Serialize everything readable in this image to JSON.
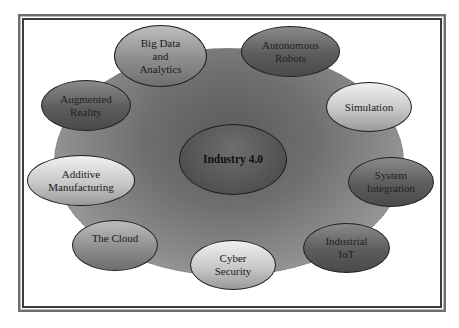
{
  "diagram": {
    "title": "Industry 4.0",
    "center": {
      "label": "Industry 4.0",
      "tone": "dark"
    },
    "nodes": [
      {
        "label": "Big Data\nand\nAnalytics",
        "tone": "mid"
      },
      {
        "label": "Autonomous\nRobots",
        "tone": "dark"
      },
      {
        "label": "Simulation",
        "tone": "light"
      },
      {
        "label": "System\nIntegration",
        "tone": "dark"
      },
      {
        "label": "Industrial\nIoT",
        "tone": "dark"
      },
      {
        "label": "Cyber\nSecurity",
        "tone": "light"
      },
      {
        "label": "The Cloud",
        "tone": "mid"
      },
      {
        "label": "Additive\nManufacturing",
        "tone": "light"
      },
      {
        "label": "Augmented\nReality",
        "tone": "dark"
      }
    ],
    "colors": {
      "frame_outer": "#6e6e6e",
      "frame_inner": "#3c3c3c",
      "blob_center": "#5a5a5a",
      "blob_edge": "#b5b5b5",
      "node_outline": "#1e1e1e"
    }
  }
}
